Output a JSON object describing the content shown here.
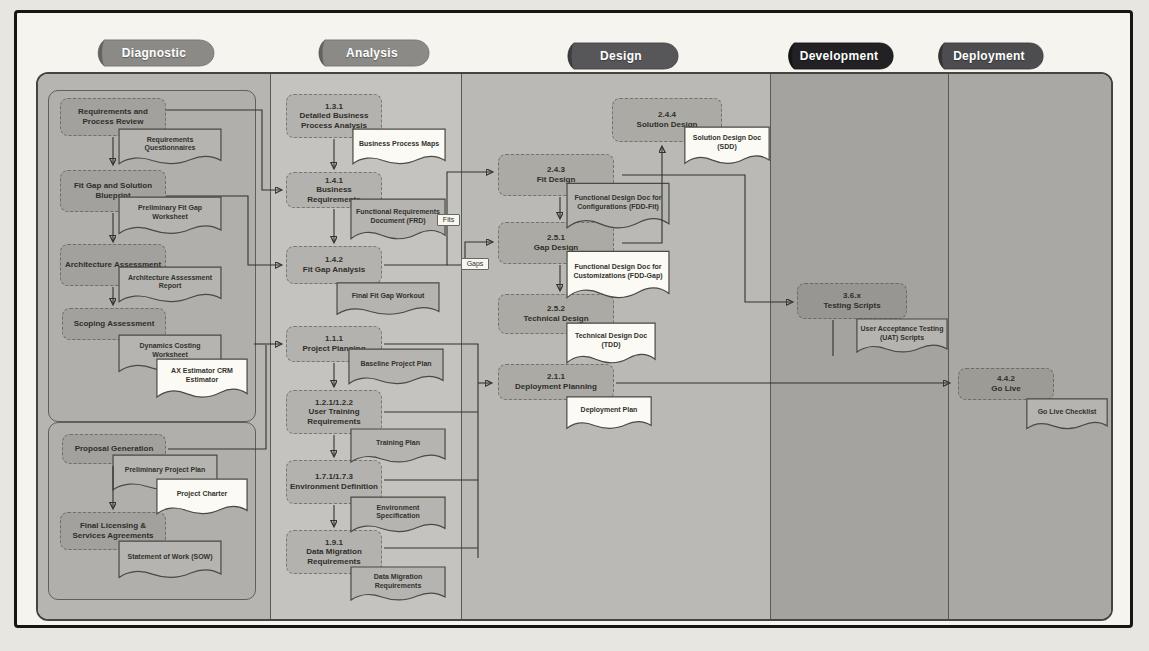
{
  "phases": [
    {
      "label": "Diagnostic",
      "color": "#8b8a87"
    },
    {
      "label": "Analysis",
      "color": "#8b8a87"
    },
    {
      "label": "Design",
      "color": "#575659"
    },
    {
      "label": "Development",
      "color": "#222124"
    },
    {
      "label": "Deployment",
      "color": "#4d4c4f"
    }
  ],
  "nodes": {
    "req_review": {
      "name": "Requirements and Process Review"
    },
    "fit_gap_blueprint": {
      "name": "Fit Gap and Solution Blueprint"
    },
    "arch_assessment": {
      "name": "Architecture Assessment"
    },
    "scoping_assessment": {
      "name": "Scoping Assessment"
    },
    "proposal_generation": {
      "name": "Proposal Generation"
    },
    "final_licensing": {
      "name": "Final Licensing & Services Agreements"
    },
    "detailed_bpa": {
      "code": "1.3.1",
      "name": "Detailed Business Process Analysis"
    },
    "business_requirements": {
      "code": "1.4.1",
      "name": "Business Requirements"
    },
    "fit_gap_analysis": {
      "code": "1.4.2",
      "name": "Fit Gap Analysis"
    },
    "project_planning": {
      "code": "1.1.1",
      "name": "Project Planning"
    },
    "user_training": {
      "code": "1.2.1/1.2.2",
      "name": "User Training Requirements"
    },
    "environment_definition": {
      "code": "1.7.1/1.7.3",
      "name": "Environment Definition"
    },
    "data_migration": {
      "code": "1.9.1",
      "name": "Data Migration Requirements"
    },
    "fit_design": {
      "code": "2.4.3",
      "name": "Fit Design"
    },
    "gap_design": {
      "code": "2.5.1",
      "name": "Gap Design"
    },
    "technical_design": {
      "code": "2.5.2",
      "name": "Technical Design"
    },
    "solution_design": {
      "code": "2.4.4",
      "name": "Solution Design"
    },
    "deployment_planning": {
      "code": "2.1.1",
      "name": "Deployment Planning"
    },
    "testing_scripts": {
      "code": "3.6.x",
      "name": "Testing Scripts"
    },
    "go_live": {
      "code": "4.4.2",
      "name": "Go Live"
    }
  },
  "documents": {
    "requirements_questionnaires": {
      "label": "Requirements Questionnaires"
    },
    "preliminary_fit_gap": {
      "label": "Preliminary Fit Gap Worksheet"
    },
    "architecture_report": {
      "label": "Architecture Assessment Report"
    },
    "dynamics_costing": {
      "label": "Dynamics Costing Worksheet"
    },
    "estimators": {
      "label": "AX Estimator CRM Estimator"
    },
    "preliminary_project_plan": {
      "label": "Preliminary Project Plan"
    },
    "project_charter": {
      "label": "Project Charter"
    },
    "statement_of_work": {
      "label": "Statement of Work (SOW)"
    },
    "business_process_maps": {
      "label": "Business Process Maps"
    },
    "frd": {
      "label": "Functional Requirements Document (FRD)"
    },
    "final_fit_gap": {
      "label": "Final Fit Gap Workout"
    },
    "baseline_project_plan": {
      "label": "Baseline Project Plan"
    },
    "training_plan": {
      "label": "Training Plan"
    },
    "environment_spec": {
      "label": "Environment Specification"
    },
    "data_migration_req": {
      "label": "Data Migration Requirements"
    },
    "fdd_fit": {
      "label": "Functional Design Doc for Configurations (FDD-Fit)"
    },
    "fdd_gap": {
      "label": "Functional Design Doc for Customizations (FDD-Gap)"
    },
    "tdd": {
      "label": "Technical Design Doc (TDD)"
    },
    "sdd": {
      "label": "Solution Design Doc (SDD)"
    },
    "deployment_plan": {
      "label": "Deployment Plan"
    },
    "uat_scripts": {
      "label": "User Acceptance Testing (UAT) Scripts"
    },
    "go_live_checklist": {
      "label": "Go Live Checklist"
    }
  },
  "connector_labels": {
    "fits": "Fits",
    "gaps": "Gaps"
  }
}
